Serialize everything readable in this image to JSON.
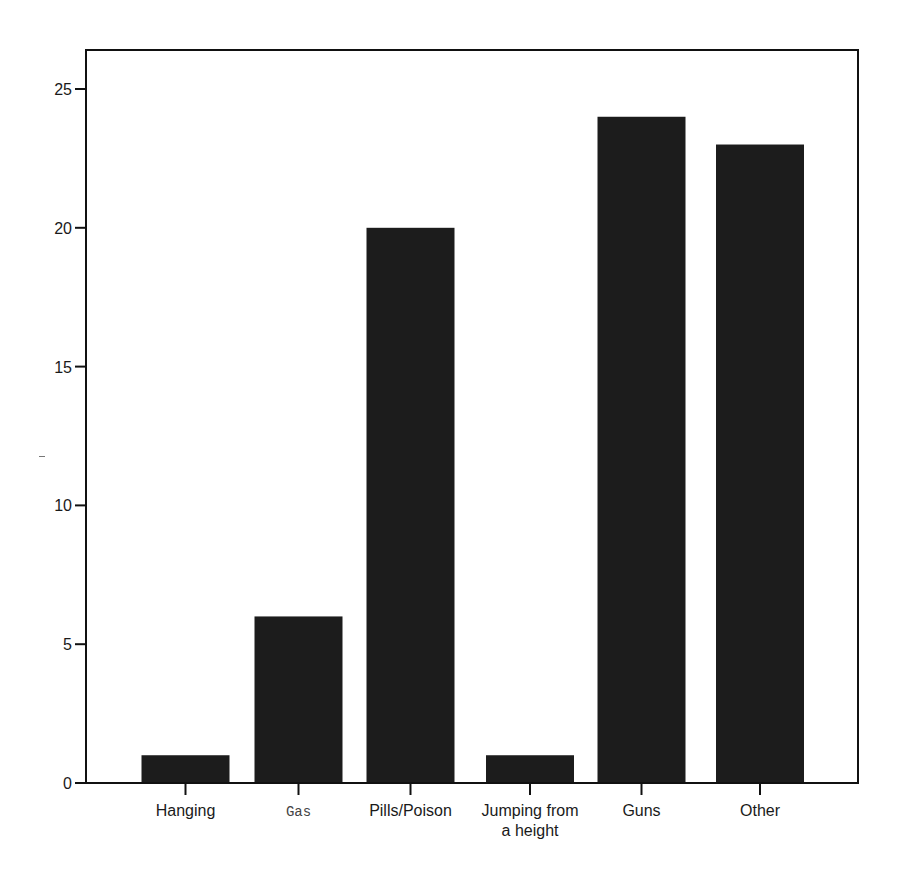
{
  "chart_data": {
    "type": "bar",
    "title": "",
    "xlabel": "",
    "ylabel": "",
    "categories": [
      "Hanging",
      "Gas",
      "Pills/Poison",
      "Jumping from a height",
      "Guns",
      "Other"
    ],
    "category_label_lines": [
      [
        "Hanging"
      ],
      [
        "Gas"
      ],
      [
        "Pills/Poison"
      ],
      [
        "Jumping from",
        "a height"
      ],
      [
        "Guns"
      ],
      [
        "Other"
      ]
    ],
    "values": [
      1,
      6,
      20,
      1,
      24,
      23
    ],
    "ylim": [
      0,
      26.3
    ],
    "yticks": [
      0,
      5,
      10,
      15,
      20,
      25
    ],
    "ytick_labels": [
      "0",
      "5",
      "10",
      "15",
      "20",
      "25"
    ],
    "grid": false,
    "legend": null,
    "bar_color": "#1c1c1c",
    "frame_color": "#111111"
  }
}
